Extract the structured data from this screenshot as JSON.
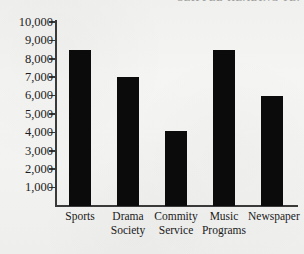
{
  "chart_data": {
    "type": "bar",
    "title": "",
    "xlabel": "",
    "ylabel": "",
    "categories": [
      "Sports",
      "Drama Society",
      "Commity Service",
      "Music Programs",
      "Newspaper"
    ],
    "category_lines": [
      [
        "Sports",
        ""
      ],
      [
        "Drama",
        "Society"
      ],
      [
        "Commity",
        "Service"
      ],
      [
        "Music",
        "Programs"
      ],
      [
        "Newspaper",
        ""
      ]
    ],
    "values": [
      8500,
      7000,
      4100,
      8500,
      6000
    ],
    "ylim": [
      0,
      10000
    ],
    "ytick_values": [
      10000,
      9000,
      8000,
      7000,
      6000,
      5000,
      4000,
      3000,
      2000,
      1000
    ],
    "ytick_labels": [
      "10,000",
      "9,000",
      "8,000",
      "7,000",
      "6,000",
      "5,000",
      "4,000",
      "3,000",
      "2,000",
      "1,000"
    ],
    "grid": false,
    "legend": null,
    "bar_color": "#0b0b0b",
    "axis_color": "#3a3a3a",
    "background_color": "#f3f3f1"
  },
  "page": {
    "title_remnant": "CLIPPED HEADING TEXT"
  }
}
